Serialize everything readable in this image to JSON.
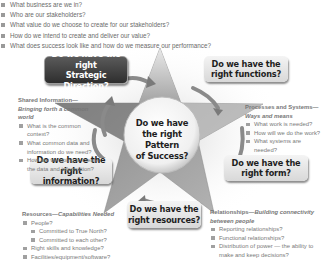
{
  "top_questions": [
    "What business are we in?",
    "Who are our stakeholders?",
    "What value do we choose to create for our stakeholders?",
    "How do we intend to create and deliver our value?",
    "What does success look like and how do we measure our performance?"
  ],
  "center": {
    "line1": "Do we have",
    "line2": "the right Pattern",
    "line3": "of Success?"
  },
  "boxes": {
    "strategic_direction": {
      "line1": "Do we have the right",
      "line2": "Strategic Direction?"
    },
    "functions": {
      "line1": "Do we have the",
      "line2": "right functions?"
    },
    "information": {
      "line1": "Do we have the right",
      "line2": "information?"
    },
    "form": {
      "line1": "Do we have the",
      "line2": "right form?"
    },
    "resources": {
      "line1": "Do we have the",
      "line2": "right resources?"
    }
  },
  "sections": {
    "shared_information": {
      "head": "Shared Information—",
      "head_italic": "Bringing forth a common world",
      "items": [
        "What is the common context?",
        "What common data and information do we need?",
        "How are we going to create the data and information?"
      ]
    },
    "processes": {
      "head": "Processes and Systems—",
      "head_italic": "Ways and means",
      "items": [
        "What work is needed?",
        "How will we do the work?",
        "What systems are needed?"
      ]
    },
    "resources": {
      "head": "Resources—",
      "head_italic": "Capabilities Needed",
      "items": [
        {
          "text": "People?",
          "level": 1
        },
        {
          "text": "Committed to True North?",
          "level": 2
        },
        {
          "text": "Committed to each other?",
          "level": 2
        },
        {
          "text": "Right skills and knowledge?",
          "level": 1
        },
        {
          "text": "Facilities/equipment/software?",
          "level": 1
        }
      ]
    },
    "relationships": {
      "head": "Relationships—",
      "head_italic": "Building connectivity between people",
      "items": [
        "Reporting relationships?",
        "Functional relationships?",
        "Distribution of power — the ability to make and keep decisions?"
      ]
    }
  },
  "colors": {
    "star_light": "#e6e6e6",
    "star_dark": "#8c8c8c",
    "dark_box": "#3a3a3a",
    "text": "#1e1e1e",
    "muted_text": "#777777"
  }
}
